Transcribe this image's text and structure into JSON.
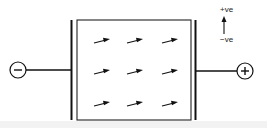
{
  "diagram": {
    "type": "parallel-plate-capacitor-with-dielectric",
    "terminals": {
      "left": {
        "symbol": "−",
        "polarity": "negative"
      },
      "right": {
        "symbol": "+",
        "polarity": "positive"
      }
    },
    "field_arrows": {
      "rows": 3,
      "columns": 3,
      "direction": "right, slightly upward"
    },
    "legend": {
      "top_label": "+ve",
      "bottom_label": "−ve",
      "arrow_direction": "up"
    }
  }
}
